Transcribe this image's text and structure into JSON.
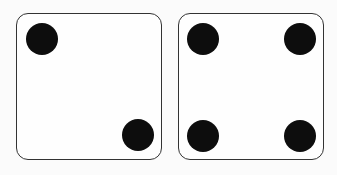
{
  "dice": [
    {
      "name": "die-left",
      "value": 2,
      "pips": [
        {
          "x": 9,
          "y": 9
        },
        {
          "x": 105,
          "y": 105
        }
      ]
    },
    {
      "name": "die-right",
      "value": 4,
      "pips": [
        {
          "x": 8,
          "y": 9
        },
        {
          "x": 105,
          "y": 9
        },
        {
          "x": 8,
          "y": 106
        },
        {
          "x": 105,
          "y": 106
        }
      ]
    }
  ],
  "colors": {
    "pip": "#0d0d0d",
    "border": "#333333",
    "face": "#fefefe"
  }
}
